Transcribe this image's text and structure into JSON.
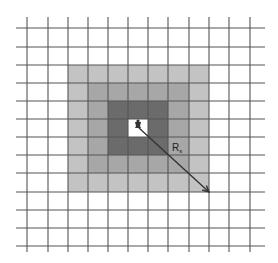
{
  "diagram": {
    "type": "grid-neighborhood",
    "grid": {
      "vertical_lines_x": [
        27,
        48,
        68,
        88,
        108,
        128,
        148,
        168,
        189,
        209,
        229,
        250
      ],
      "horizontal_lines_y": [
        28,
        47,
        65,
        83,
        101,
        119,
        137,
        155,
        173,
        192,
        210,
        228,
        246
      ],
      "x_extent": [
        16,
        265
      ],
      "y_extent": [
        17,
        252
      ],
      "line_color": "#555555"
    },
    "rings": [
      {
        "name": "outer-ring",
        "x0": 68,
        "y0": 65,
        "x1": 209,
        "y1": 192,
        "color": "#c3c3c3"
      },
      {
        "name": "middle-ring",
        "x0": 88,
        "y0": 83,
        "x1": 189,
        "y1": 173,
        "color": "#a7a7a7"
      },
      {
        "name": "inner-ring",
        "x0": 108,
        "y0": 101,
        "x1": 168,
        "y1": 155,
        "color": "#6b6b6b"
      },
      {
        "name": "center-cell",
        "x0": 128,
        "y0": 119,
        "x1": 148,
        "y1": 137,
        "color": "#ffffff"
      }
    ],
    "center_marker": {
      "x": 138,
      "y": 126,
      "color": "#333333"
    },
    "arrow": {
      "x1": 139,
      "y1": 128,
      "x2": 209,
      "y2": 192,
      "color": "#333333"
    },
    "label": {
      "main": "R",
      "subscript": "s",
      "x": 172,
      "y": 151
    }
  }
}
